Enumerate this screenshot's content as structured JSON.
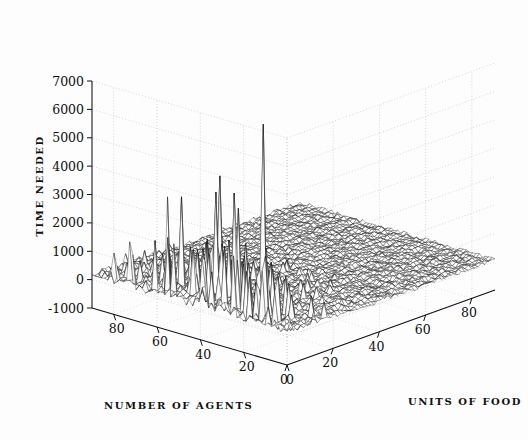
{
  "figure": {
    "background_color": "#fdfdfd",
    "ink_color": "#111111",
    "grid_color": "#c9c9c9"
  },
  "chart_data": {
    "type": "surface",
    "title": "",
    "subtitle": "",
    "xlabel": "NUMBER OF AGENTS",
    "ylabel": "UNITS OF FOOD",
    "zlabel": "TIME NEEDED",
    "grid": true,
    "legend": "none",
    "projection": "3d-mesh",
    "xlim": [
      0,
      90
    ],
    "ylim": [
      0,
      90
    ],
    "zlim": [
      -1000,
      7000
    ],
    "xticks": [
      0,
      20,
      40,
      60,
      80
    ],
    "yticks": [
      0,
      20,
      40,
      60,
      80
    ],
    "zticks": [
      -1000,
      0,
      1000,
      2000,
      3000,
      4000,
      5000,
      6000,
      7000
    ],
    "xtick_labels": [
      "0",
      "20",
      "40",
      "60",
      "80"
    ],
    "ytick_labels": [
      "0",
      "20",
      "40",
      "60",
      "80"
    ],
    "ztick_labels": [
      "-1000",
      "0",
      "1000",
      "2000",
      "3000",
      "4000",
      "5000",
      "6000",
      "7000"
    ],
    "grid_n": 62,
    "mesh_color": "#1a1a1a",
    "max_value": 6700,
    "min_value": 0,
    "baseline_value": 0,
    "noise_amplitude": 220,
    "spike_region": "low agents and low food",
    "notable_spikes": [
      {
        "x": 22,
        "y": 10,
        "z": 6700
      },
      {
        "x": 47,
        "y": 14,
        "z": 4200
      },
      {
        "x": 42,
        "y": 8,
        "z": 3900
      },
      {
        "x": 35,
        "y": 12,
        "z": 3400
      },
      {
        "x": 60,
        "y": 10,
        "z": 3300
      },
      {
        "x": 16,
        "y": 6,
        "z": 2600
      },
      {
        "x": 52,
        "y": 20,
        "z": 2400
      },
      {
        "x": 8,
        "y": 4,
        "z": 1800
      }
    ]
  }
}
